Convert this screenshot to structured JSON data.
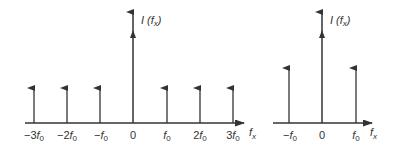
{
  "left_plot": {
    "y_label": "I (f",
    "y_label_sub": "x",
    "y_label_close": ")",
    "x_label": "f",
    "x_label_sub": "x",
    "impulses": [
      {
        "pre": "−3",
        "f": "f",
        "sub": "0",
        "x": 34
      },
      {
        "pre": "−2",
        "f": "f",
        "sub": "0",
        "x": 67
      },
      {
        "pre": "−",
        "f": "f",
        "sub": "0",
        "x": 100
      },
      {
        "pre": "0",
        "f": "",
        "sub": "",
        "x": 133
      },
      {
        "pre": "",
        "f": "f",
        "sub": "0",
        "x": 167
      },
      {
        "pre": "2",
        "f": "f",
        "sub": "0",
        "x": 200
      },
      {
        "pre": "3",
        "f": "f",
        "sub": "0",
        "x": 233
      }
    ]
  },
  "right_plot": {
    "y_label": "I (f",
    "y_label_sub": "x",
    "y_label_close": ")",
    "x_label": "f",
    "x_label_sub": "x",
    "impulses": [
      {
        "pre": "−",
        "f": "f",
        "sub": "0",
        "x": 289
      },
      {
        "pre": "0",
        "f": "",
        "sub": "",
        "x": 322
      },
      {
        "pre": "",
        "f": "f",
        "sub": "0",
        "x": 356
      }
    ]
  },
  "colors": {
    "stroke": "#333333"
  }
}
